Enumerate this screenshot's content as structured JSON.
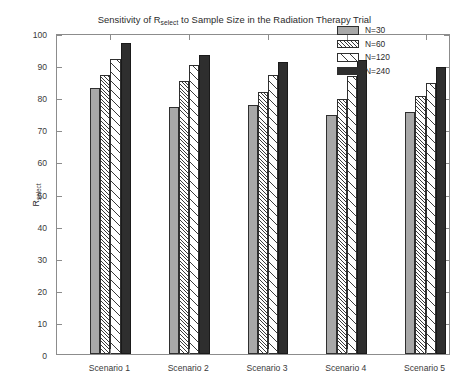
{
  "title": {
    "prefix": "Sensitivity of R",
    "subscript": "select",
    "suffix": " to Sample Size in the Radiation Therapy Trial"
  },
  "axes": {
    "ylabel_main": "R",
    "ylabel_sub": "select",
    "ytick_labels": [
      "0",
      "10",
      "20",
      "30",
      "40",
      "50",
      "60",
      "70",
      "80",
      "90",
      "100"
    ],
    "xtick_labels": [
      "Scenario 1",
      "Scenario 2",
      "Scenario 3",
      "Scenario 4",
      "Scenario 5"
    ]
  },
  "legend": {
    "items": [
      {
        "label": "N=30",
        "swatch": "solid-gray",
        "color": "#a8a8a8"
      },
      {
        "label": "N=60",
        "swatch": "dense-hatch",
        "color": "#3a3a3a"
      },
      {
        "label": "N=120",
        "swatch": "sparse-hatch",
        "color": "#3a3a3a"
      },
      {
        "label": "N=240",
        "swatch": "solid-dark",
        "color": "#2e2e2e"
      }
    ]
  },
  "chart_data": {
    "type": "bar",
    "xlabel": "",
    "ylabel": "R_select",
    "ylim": [
      0,
      100
    ],
    "ytick_step": 10,
    "grid": false,
    "legend_position": "upper right (inside)",
    "categories": [
      "Scenario 1",
      "Scenario 2",
      "Scenario 3",
      "Scenario 4",
      "Scenario 5"
    ],
    "series": [
      {
        "name": "N=30",
        "values": [
          83.0,
          77.0,
          77.5,
          74.5,
          75.5
        ]
      },
      {
        "name": "N=60",
        "values": [
          87.0,
          85.0,
          81.5,
          79.5,
          80.5
        ]
      },
      {
        "name": "N=120",
        "values": [
          92.0,
          90.0,
          87.0,
          86.5,
          84.5
        ]
      },
      {
        "name": "N=240",
        "values": [
          97.0,
          93.0,
          91.0,
          91.5,
          89.5
        ]
      }
    ]
  }
}
